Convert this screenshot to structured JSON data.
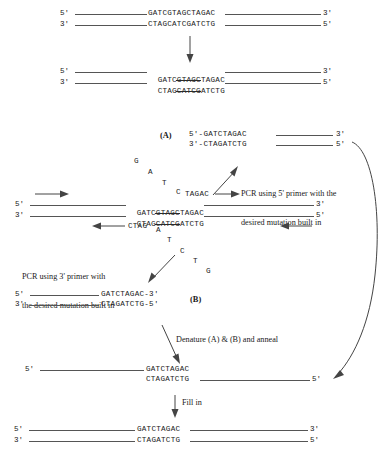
{
  "figure": {
    "ticks": {
      "five": "5'",
      "three": "3'"
    },
    "labels": {
      "panel_a": "(A)",
      "panel_b": "(B)"
    }
  },
  "step1": {
    "top_seq": "GATCGTAGCTAGAC",
    "bottom_seq": "CTAGCATCGATCTG",
    "left_tick_top": "5'",
    "left_tick_bottom": "3'",
    "right_tick_top": "3'",
    "right_tick_bottom": "5'"
  },
  "step2": {
    "top_pre": "GATC",
    "top_struck": "GTAGC",
    "top_post": "TAGAC",
    "bottom_pre": "CTAG",
    "bottom_struck": "CATCG",
    "bottom_post": "ATCTG",
    "left_tick_top": "5'",
    "left_tick_bottom": "3'",
    "right_tick_top": "3'",
    "right_tick_bottom": "5'"
  },
  "panel_a": {
    "label": "(A)",
    "top_line": "5'-GATCTAGAC",
    "bottom_line": "3'-CTAGATCTG",
    "right_tick_top": "3'",
    "right_tick_bottom": "5'"
  },
  "panel_b": {
    "label": "(B)",
    "top_line": "GATCTAGAC-3'",
    "bottom_line": "CTAGATCTG-5'",
    "left_tick_top": "5'",
    "left_tick_bottom": "3'"
  },
  "template": {
    "top_pre": "GATC",
    "top_struck": "GTAGC",
    "top_post": "TAGAC",
    "bottom_pre": "CTAG",
    "bottom_struck": "CATCG",
    "bottom_post": "ATCTG",
    "left_tick_top": "5'",
    "left_tick_bottom": "3'",
    "right_tick_top": "3'",
    "right_tick_bottom": "5'"
  },
  "primer_top": {
    "loop_bases": [
      "G",
      "A",
      "T",
      "C"
    ],
    "annealed": "TAGAC",
    "note_line1": "PCR using 5' primer with the",
    "note_line2": "desired mutation built in"
  },
  "primer_bottom": {
    "annealed": "CTAG",
    "loop_bases": [
      "A",
      "T",
      "C",
      "T",
      "G"
    ],
    "note_line1": "PCR using 3' primer with",
    "note_line2": "the desired mutation built in"
  },
  "anneal": {
    "caption": "Denature (A) & (B) and anneal",
    "top_seq": "GATCTAGAC",
    "bottom_seq": "CTAGATCTG",
    "left_tick_top": "5'",
    "right_tick_bottom": "5'"
  },
  "fillin": {
    "caption": "Fill in",
    "top_seq": "GATCTAGAC",
    "bottom_seq": "CTAGATCTG",
    "left_tick_top": "5'",
    "left_tick_bottom": "3'",
    "right_tick_top": "3'",
    "right_tick_bottom": "5'"
  },
  "colors": {
    "ink": "#1a1a1a",
    "line": "#555555",
    "arrow": "#444444",
    "background": "#ffffff"
  }
}
